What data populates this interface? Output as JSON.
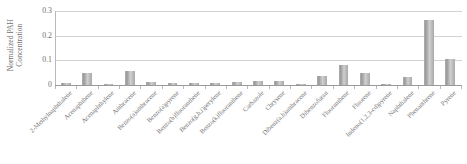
{
  "chart_data": {
    "type": "bar",
    "title": "",
    "xlabel": "",
    "ylabel": "Normalized PAH Concentration",
    "ylabel_lines": [
      "Normalized PAH",
      "Concentration"
    ],
    "ylim": [
      0,
      0.3
    ],
    "ytick_labels": [
      "0.3",
      "0.2",
      "0.1",
      "0"
    ],
    "ytick_values": [
      0.3,
      0.2,
      0.1,
      0
    ],
    "grid": true,
    "legend": "none",
    "bar_color": "#a9a9a9",
    "categories": [
      "2-Methylnaphthalene",
      "Acenaphthene",
      "Acenaphthylene",
      "Anthracene",
      "Benzo(a)anthracene",
      "Benzo(a)pyrene",
      "Benzo(b)fluoranthene",
      "Benzo(g,h,i)perylene",
      "Benzo(k)fluoranthene",
      "Carbazole",
      "Chrysene",
      "Dibenz(a,h)anthracene",
      "Dibenzofuran",
      "Fluoranthene",
      "Fluorene",
      "Indeno(1,2,3-cd)pyrene",
      "Naphthalene",
      "Phenanthrene",
      "Pyrene"
    ],
    "values": [
      0.01,
      0.047,
      0.003,
      0.057,
      0.014,
      0.007,
      0.008,
      0.009,
      0.012,
      0.017,
      0.015,
      0.001,
      0.035,
      0.08,
      0.05,
      0.004,
      0.032,
      0.265,
      0.105
    ]
  }
}
